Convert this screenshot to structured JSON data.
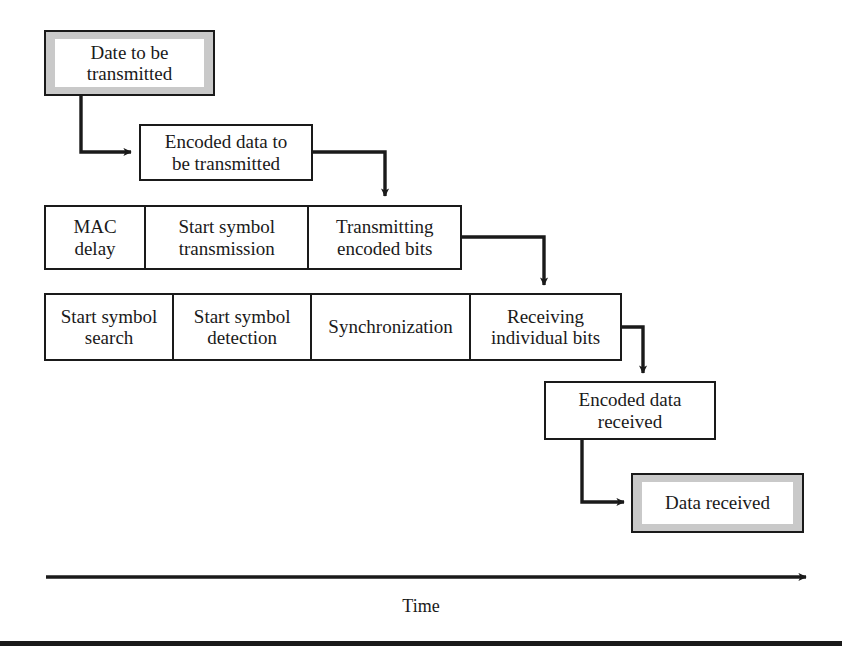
{
  "diagram": {
    "title_text": "Time",
    "time_axis_label": "Time",
    "colors": {
      "line": "#1a1a1a",
      "highlight_fill": "#c9c9c9",
      "box_fill": "#ffffff"
    },
    "nodes": {
      "data_to_be_transmitted": "Date to be\ntransmitted",
      "data_to_be_transmitted_line1": "Date to be",
      "data_to_be_transmitted_line2": "transmitted",
      "encoded_data_to_be_transmitted_line1": "Encoded data to",
      "encoded_data_to_be_transmitted_line2": "be transmitted",
      "encoded_data_received_line1": "Encoded data",
      "encoded_data_received_line2": "received",
      "data_received": "Data received"
    },
    "transmitter_row": {
      "cells": [
        {
          "line1": "MAC",
          "line2": "delay"
        },
        {
          "line1": "Start symbol",
          "line2": "transmission"
        },
        {
          "line1": "Transmitting",
          "line2": "encoded bits"
        }
      ]
    },
    "receiver_row": {
      "cells": [
        {
          "line1": "Start symbol",
          "line2": "search"
        },
        {
          "line1": "Start symbol",
          "line2": "detection"
        },
        {
          "line1": "Synchronization",
          "line2": ""
        },
        {
          "line1": "Receiving",
          "line2": "individual bits"
        }
      ]
    }
  }
}
